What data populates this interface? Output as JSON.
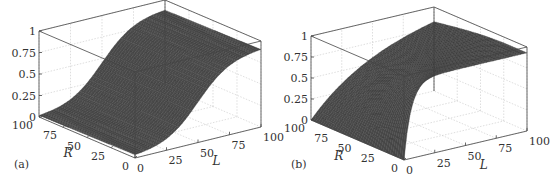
{
  "chart_data": [
    {
      "type": "surface",
      "panel_label": "(a)",
      "xlabel": "L",
      "ylabel": "R",
      "zlabel": "",
      "x_ticks": [
        "0",
        "25",
        "50",
        "75",
        "100"
      ],
      "y_ticks": [
        "0",
        "25",
        "50",
        "75",
        "100"
      ],
      "z_ticks": [
        "0",
        "0.25",
        "0.5",
        "0.75",
        "1"
      ],
      "xlim": [
        0,
        100
      ],
      "ylim": [
        0,
        100
      ],
      "zlim": [
        0,
        1
      ],
      "grid": true,
      "description": "Sigmoidal surface rising along L, roughly independent of R",
      "samples": {
        "L": [
          0,
          25,
          50,
          75,
          100
        ],
        "R": [
          0,
          50,
          100
        ],
        "z": [
          [
            0.05,
            0.2,
            0.5,
            0.8,
            0.92
          ],
          [
            0.03,
            0.18,
            0.5,
            0.82,
            0.93
          ],
          [
            0.0,
            0.15,
            0.48,
            0.82,
            0.95
          ]
        ]
      },
      "geometry": {
        "origin": [
          135,
          158
        ],
        "r_end": [
          39,
          117
        ],
        "l_end": [
          261,
          127
        ],
        "z_height": 86
      }
    },
    {
      "type": "surface",
      "panel_label": "(b)",
      "xlabel": "L",
      "ylabel": "R",
      "zlabel": "",
      "x_ticks": [
        "0",
        "25",
        "50",
        "75",
        "100"
      ],
      "y_ticks": [
        "0",
        "25",
        "50",
        "75",
        "100"
      ],
      "z_ticks": [
        "0",
        "0.25",
        "0.5",
        "0.75",
        "1"
      ],
      "xlim": [
        0,
        100
      ],
      "ylim": [
        0,
        100
      ],
      "zlim": [
        0,
        1
      ],
      "grid": true,
      "description": "Surface rising steeply in L at low R, gradually toward ~0.9 at L=100",
      "samples": {
        "L": [
          0,
          25,
          50,
          75,
          100
        ],
        "R": [
          0,
          50,
          100
        ],
        "z": [
          [
            0.15,
            0.75,
            0.85,
            0.9,
            0.92
          ],
          [
            0.0,
            0.4,
            0.7,
            0.85,
            0.92
          ],
          [
            0.0,
            0.2,
            0.5,
            0.75,
            0.92
          ]
        ]
      },
      "geometry": {
        "origin": [
          404,
          160
        ],
        "r_end": [
          311,
          120
        ],
        "l_end": [
          527,
          131
        ],
        "z_height": 84
      }
    }
  ]
}
